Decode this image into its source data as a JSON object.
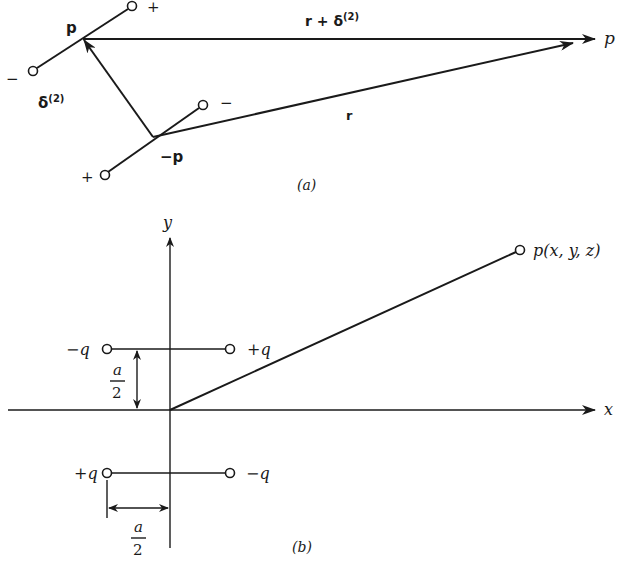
{
  "figure_a": {
    "caption": "(a)",
    "dipole_p": {
      "label": "p",
      "plus": "+",
      "minus": "−"
    },
    "dipole_neg_p": {
      "label": "−p",
      "plus": "+",
      "minus": "−"
    },
    "delta_label": "δ",
    "delta_sup": "(2)",
    "r_plus_delta_label": "r + δ",
    "r_plus_delta_sup": "(2)",
    "r_label": "r",
    "point_label": "p"
  },
  "figure_b": {
    "caption": "(b)",
    "y_axis_label": "y",
    "x_axis_label": "x",
    "upper_left_charge": "−q",
    "upper_right_charge": "+q",
    "lower_left_charge": "+q",
    "lower_right_charge": "−q",
    "vertical_distance_num": "a",
    "vertical_distance_den": "2",
    "horizontal_distance_num": "a",
    "horizontal_distance_den": "2",
    "point_label": "p(x, y, z)"
  }
}
